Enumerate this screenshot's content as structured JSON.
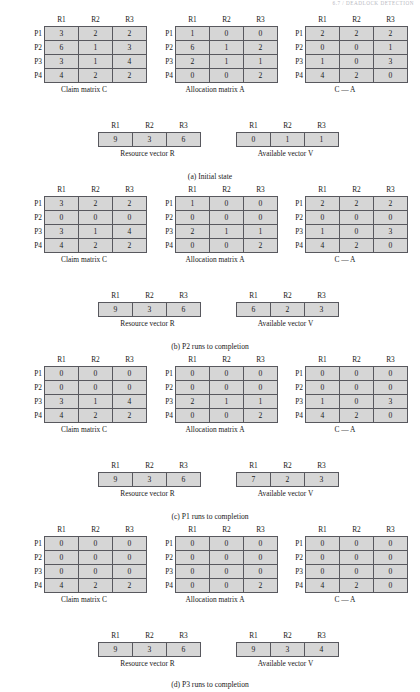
{
  "running_head": "6.7 / DEADLOCK DETECTION",
  "labels": {
    "col_headers": [
      "R1",
      "R2",
      "R3"
    ],
    "row_headers": [
      "P1",
      "P2",
      "P3",
      "P4"
    ],
    "claim_caption": "Claim matrix C",
    "allocation_caption": "Allocation matrix A",
    "difference_caption": "C — A",
    "resource_caption": "Resource vector R",
    "available_caption": "Available vector V"
  },
  "colors": {
    "cell_fill": "#d6d6d6",
    "cell_border": "#58585e",
    "text": "#1a1a1a",
    "page_background": "#ffffff"
  },
  "panels": [
    {
      "id": "panel-a",
      "caption": "(a) Initial state",
      "claim": [
        [
          3,
          2,
          2
        ],
        [
          6,
          1,
          3
        ],
        [
          3,
          1,
          4
        ],
        [
          4,
          2,
          2
        ]
      ],
      "allocation": [
        [
          1,
          0,
          0
        ],
        [
          6,
          1,
          2
        ],
        [
          2,
          1,
          1
        ],
        [
          0,
          0,
          2
        ]
      ],
      "difference": [
        [
          2,
          2,
          2
        ],
        [
          0,
          0,
          1
        ],
        [
          1,
          0,
          3
        ],
        [
          4,
          2,
          0
        ]
      ],
      "resource": [
        9,
        3,
        6
      ],
      "available": [
        0,
        1,
        1
      ]
    },
    {
      "id": "panel-b",
      "caption": "(b) P2 runs to completion",
      "claim": [
        [
          3,
          2,
          2
        ],
        [
          0,
          0,
          0
        ],
        [
          3,
          1,
          4
        ],
        [
          4,
          2,
          2
        ]
      ],
      "allocation": [
        [
          1,
          0,
          0
        ],
        [
          0,
          0,
          0
        ],
        [
          2,
          1,
          1
        ],
        [
          0,
          0,
          2
        ]
      ],
      "difference": [
        [
          2,
          2,
          2
        ],
        [
          0,
          0,
          0
        ],
        [
          1,
          0,
          3
        ],
        [
          4,
          2,
          0
        ]
      ],
      "resource": [
        9,
        3,
        6
      ],
      "available": [
        6,
        2,
        3
      ]
    },
    {
      "id": "panel-c",
      "caption": "(c) P1 runs to completion",
      "claim": [
        [
          0,
          0,
          0
        ],
        [
          0,
          0,
          0
        ],
        [
          3,
          1,
          4
        ],
        [
          4,
          2,
          2
        ]
      ],
      "allocation": [
        [
          0,
          0,
          0
        ],
        [
          0,
          0,
          0
        ],
        [
          2,
          1,
          1
        ],
        [
          0,
          0,
          2
        ]
      ],
      "difference": [
        [
          0,
          0,
          0
        ],
        [
          0,
          0,
          0
        ],
        [
          1,
          0,
          3
        ],
        [
          4,
          2,
          0
        ]
      ],
      "resource": [
        9,
        3,
        6
      ],
      "available": [
        7,
        2,
        3
      ]
    },
    {
      "id": "panel-d",
      "caption": "(d) P3 runs to completion",
      "claim": [
        [
          0,
          0,
          0
        ],
        [
          0,
          0,
          0
        ],
        [
          0,
          0,
          0
        ],
        [
          4,
          2,
          2
        ]
      ],
      "allocation": [
        [
          0,
          0,
          0
        ],
        [
          0,
          0,
          0
        ],
        [
          0,
          0,
          0
        ],
        [
          0,
          0,
          2
        ]
      ],
      "difference": [
        [
          0,
          0,
          0
        ],
        [
          0,
          0,
          0
        ],
        [
          0,
          0,
          0
        ],
        [
          4,
          2,
          0
        ]
      ],
      "resource": [
        9,
        3,
        6
      ],
      "available": [
        9,
        3,
        4
      ]
    }
  ]
}
